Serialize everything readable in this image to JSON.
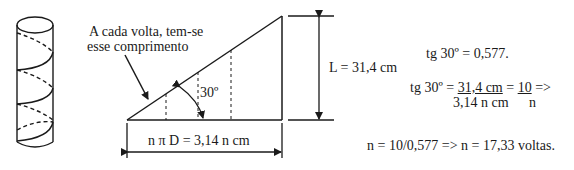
{
  "annotation": {
    "line1": "A cada volta, tem-se",
    "line2": "esse comprimento"
  },
  "angle_label": "30º",
  "base_label": "n π D = 3,14 n cm",
  "height_label": "L = 31,4 cm",
  "equations": {
    "eq1": "tg 30º = 0,577.",
    "eq2_prefix": "tg 30º = ",
    "eq2_num1": "31,4 cm",
    "eq2_mid": " = ",
    "eq2_num2": "10",
    "eq2_suffix": " =>",
    "eq2_den1": "3,14 n cm",
    "eq2_den2": "n",
    "eq3": "n = 10/0,577 => n = 17,33 voltas."
  },
  "colors": {
    "stroke": "#1a1a1a",
    "background": "#ffffff"
  }
}
